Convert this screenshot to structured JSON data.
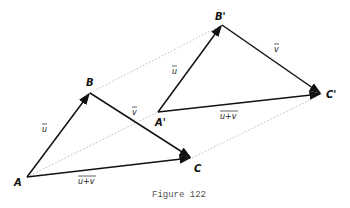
{
  "caption": "Figure 122",
  "points": {
    "A": {
      "label": "A",
      "x": 27,
      "y": 177
    },
    "B": {
      "label": "B",
      "x": 90,
      "y": 93
    },
    "C": {
      "label": "C",
      "x": 192,
      "y": 158
    },
    "A2": {
      "label": "A'",
      "x": 158,
      "y": 112
    },
    "B2": {
      "label": "B'",
      "x": 222,
      "y": 25
    },
    "C2": {
      "label": "C'",
      "x": 322,
      "y": 94
    }
  },
  "vector_labels": {
    "u": "u",
    "v": "v",
    "sum": "u+v"
  },
  "colors": {
    "line": "#111111",
    "dotted": "#bbbbbb"
  }
}
